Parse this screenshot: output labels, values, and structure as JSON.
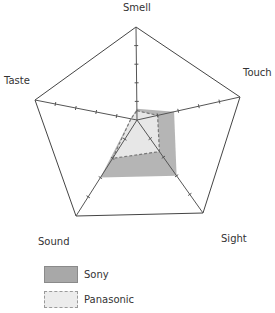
{
  "chart_data": {
    "type": "radar",
    "title": "",
    "axes": [
      "Smell",
      "Touch",
      "Sight",
      "Sound",
      "Taste"
    ],
    "range": [
      0,
      5
    ],
    "ticks_per_axis": 5,
    "grid": "outer pentagon only",
    "legend_position": "bottom-left",
    "series": [
      {
        "name": "Sony",
        "values": [
          0.6,
          1.8,
          3.0,
          3.0,
          0.3
        ],
        "fill": "#a8a8a8",
        "line": "solid"
      },
      {
        "name": "Panasonic",
        "values": [
          0.5,
          1.0,
          1.7,
          2.0,
          0.3
        ],
        "fill": "#ececec",
        "line": "dashed"
      }
    ]
  },
  "labels": {
    "smell": "Smell",
    "touch": "Touch",
    "sight": "Sight",
    "sound": "Sound",
    "taste": "Taste"
  },
  "legend": {
    "items": [
      {
        "label": "Sony"
      },
      {
        "label": "Panasonic"
      }
    ]
  }
}
